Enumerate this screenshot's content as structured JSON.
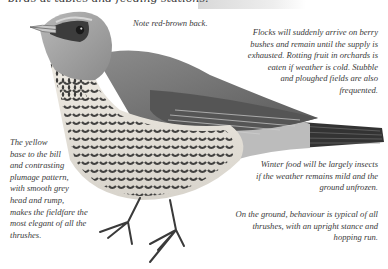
{
  "page": {
    "top_line": "birds at tables and feeding stations."
  },
  "illustration": {
    "subject": "Fieldfare",
    "palette": {
      "head_grey": "#9a9a9a",
      "back": "#6e6e6e",
      "breast": "#e6e2da",
      "spots": "#2b2b2b",
      "tail": "#3a3a3a",
      "bill": "#c8c8c8"
    }
  },
  "annotations": {
    "back": "Note red-brown back.",
    "flocks": [
      "Flocks will suddenly arrive on berry",
      "bushes and remain until the supply is",
      "exhausted. Rotting fruit in orchards is",
      "eaten if weather is cold. Stubble",
      "and ploughed fields are also",
      "frequented."
    ],
    "yellow_bill": [
      "The yellow",
      "base to the bill",
      "and contrasting",
      "plumage pattern,",
      "with smooth grey",
      "head and rump,",
      "makes the fieldfare the",
      "most elegant of all the",
      "thrushes."
    ],
    "winter_food": [
      "Winter food will be largely insects",
      "if the weather remains mild and the",
      "ground unfrozen."
    ],
    "behaviour": [
      "On the ground, behaviour is typical of all",
      "thrushes, with an upright stance and",
      "hopping run."
    ]
  }
}
